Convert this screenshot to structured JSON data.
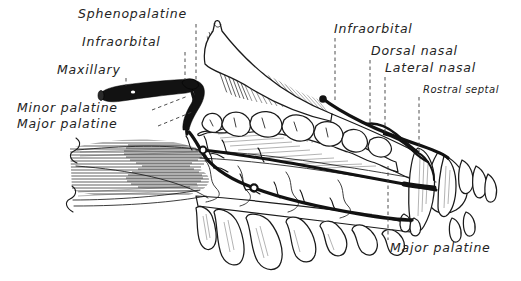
{
  "figure": {
    "background_color": "#ffffff",
    "ink_color": "#1a1a1a",
    "artery_color": "#121212",
    "label_color": "#232323",
    "leader_color": "#3a3a3a",
    "width": 521,
    "height": 281
  },
  "labels": [
    {
      "id": "sphenopalatine",
      "text": "Sphenopalatine",
      "size": "md",
      "x": 78,
      "y": 18,
      "anchor": "start",
      "leader": {
        "type": "dashed",
        "points": "196,24 196,82"
      }
    },
    {
      "id": "infraorbital-left",
      "text": "Infraorbital",
      "size": "md",
      "x": 82,
      "y": 46,
      "anchor": "start",
      "leader": {
        "type": "dashed",
        "points": "185,50 185,80"
      }
    },
    {
      "id": "maxillary",
      "text": "Maxillary",
      "size": "md",
      "x": 57,
      "y": 74,
      "anchor": "start",
      "leader": {
        "type": "dashed",
        "points": "126,78 126,84"
      }
    },
    {
      "id": "minor-palatine",
      "text": "Minor palatine",
      "size": "md",
      "x": 17,
      "y": 112,
      "anchor": "start",
      "leader": {
        "type": "dashed",
        "points": "155,108 186,97"
      }
    },
    {
      "id": "major-palatine-left",
      "text": "Major palatine",
      "size": "md",
      "x": 17,
      "y": 128,
      "anchor": "start",
      "leader": {
        "type": "dashed",
        "points": "160,124 190,113"
      }
    },
    {
      "id": "infraorbital-right",
      "text": "Infraorbital",
      "size": "md",
      "x": 334,
      "y": 33,
      "anchor": "start",
      "leader": {
        "type": "dashed",
        "points": "335,38 335,100"
      }
    },
    {
      "id": "dorsal-nasal",
      "text": "Dorsal nasal",
      "size": "md",
      "x": 371,
      "y": 55,
      "anchor": "start",
      "leader": {
        "type": "dashed",
        "points": "370,60 370,122"
      }
    },
    {
      "id": "lateral-nasal",
      "text": "Lateral nasal",
      "size": "md",
      "x": 385,
      "y": 72,
      "anchor": "start",
      "leader": {
        "type": "dashed",
        "points": "385,77 385,133"
      }
    },
    {
      "id": "rostral-septal",
      "text": "Rostral septal",
      "size": "sm",
      "x": 423,
      "y": 93,
      "anchor": "start",
      "leader": {
        "type": "dashed",
        "points": "419,97 419,152"
      }
    },
    {
      "id": "major-palatine-bottom",
      "text": "Major palatine",
      "size": "md",
      "x": 390,
      "y": 252,
      "anchor": "start",
      "leader": {
        "type": "dashed",
        "points": "388,163 388,240"
      }
    }
  ],
  "arteries": [
    {
      "id": "maxillary-trunk",
      "name": "Maxillary artery",
      "style": "thick-black-tapered"
    },
    {
      "id": "sphenopalatine-branch",
      "name": "Sphenopalatine artery",
      "style": "thick-black"
    },
    {
      "id": "infraorbital-branch",
      "name": "Infraorbital artery",
      "style": "thick-black"
    },
    {
      "id": "minor-palatine-branch",
      "name": "Minor palatine artery",
      "style": "medium-black"
    },
    {
      "id": "major-palatine-branch",
      "name": "Major palatine artery",
      "style": "medium-black-long"
    },
    {
      "id": "dorsal-nasal-branch",
      "name": "Dorsal nasal artery",
      "style": "medium-black"
    },
    {
      "id": "lateral-nasal-branch",
      "name": "Lateral nasal artery",
      "style": "medium-black"
    },
    {
      "id": "rostral-septal-branch",
      "name": "Rostral septal artery",
      "style": "thin-black"
    }
  ],
  "structures": [
    {
      "id": "cranial-vault",
      "name": "Cranial vault / frontal region"
    },
    {
      "id": "zygomatic-arch",
      "name": "Zygomatic / orbital margin"
    },
    {
      "id": "nasal-turbinates",
      "name": "Nasal turbinates (ethmoid conchae)"
    },
    {
      "id": "hard-palate",
      "name": "Hard palate"
    },
    {
      "id": "maxillary-teeth",
      "name": "Maxillary cheek teeth"
    },
    {
      "id": "canine-tooth",
      "name": "Canine tooth"
    },
    {
      "id": "incisors",
      "name": "Incisor teeth"
    },
    {
      "id": "temporalis-fan",
      "name": "Sectioned soft tissue fan (caudal cut surface)"
    },
    {
      "id": "break-lines",
      "name": "Cut-away break edges"
    }
  ]
}
